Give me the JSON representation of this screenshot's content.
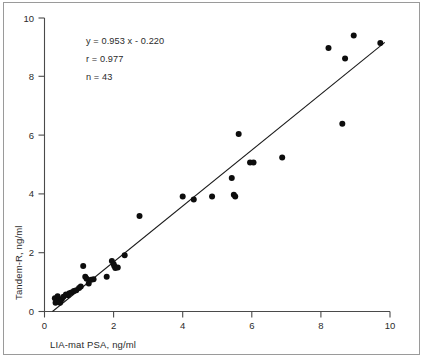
{
  "chart_data": {
    "type": "scatter",
    "title": "",
    "xlabel": "LIA-mat PSA, ng/ml",
    "ylabel": "Tandem-R, ng/ml",
    "xlim": [
      0,
      10
    ],
    "ylim": [
      0,
      10
    ],
    "xticks": [
      0,
      2,
      4,
      6,
      8,
      10
    ],
    "yticks": [
      0,
      2,
      4,
      6,
      8,
      10
    ],
    "xtick_labels": [
      "0",
      "2",
      "4",
      "6",
      "8",
      "10"
    ],
    "ytick_labels": [
      "0",
      "2",
      "4",
      "6",
      "8",
      "10"
    ],
    "grid": false,
    "legend": "none",
    "annotations": {
      "equation": "y = 0.953 x - 0.220",
      "correlation": "r = 0.977",
      "count": "n = 43"
    },
    "fit_line": {
      "slope": 0.953,
      "intercept": -0.22,
      "x_start": 0.23,
      "x_end": 9.85
    },
    "marker_color": "#0d0d0d",
    "axis_color": "#4a4a4a",
    "points": [
      {
        "x": 0.3,
        "y": 0.45
      },
      {
        "x": 0.32,
        "y": 0.3
      },
      {
        "x": 0.38,
        "y": 0.52
      },
      {
        "x": 0.42,
        "y": 0.38
      },
      {
        "x": 0.45,
        "y": 0.3
      },
      {
        "x": 0.5,
        "y": 0.42
      },
      {
        "x": 0.55,
        "y": 0.5
      },
      {
        "x": 0.62,
        "y": 0.58
      },
      {
        "x": 0.68,
        "y": 0.55
      },
      {
        "x": 0.72,
        "y": 0.62
      },
      {
        "x": 0.78,
        "y": 0.65
      },
      {
        "x": 0.85,
        "y": 0.7
      },
      {
        "x": 0.92,
        "y": 0.72
      },
      {
        "x": 1.0,
        "y": 0.8
      },
      {
        "x": 1.05,
        "y": 0.85
      },
      {
        "x": 1.12,
        "y": 1.55
      },
      {
        "x": 1.18,
        "y": 1.18
      },
      {
        "x": 1.22,
        "y": 1.12
      },
      {
        "x": 1.28,
        "y": 0.95
      },
      {
        "x": 1.35,
        "y": 1.08
      },
      {
        "x": 1.42,
        "y": 1.1
      },
      {
        "x": 1.8,
        "y": 1.18
      },
      {
        "x": 1.95,
        "y": 1.72
      },
      {
        "x": 2.0,
        "y": 1.62
      },
      {
        "x": 2.02,
        "y": 1.55
      },
      {
        "x": 2.05,
        "y": 1.48
      },
      {
        "x": 2.12,
        "y": 1.5
      },
      {
        "x": 2.32,
        "y": 1.92
      },
      {
        "x": 2.75,
        "y": 3.25
      },
      {
        "x": 4.0,
        "y": 3.92
      },
      {
        "x": 4.32,
        "y": 3.82
      },
      {
        "x": 4.85,
        "y": 3.92
      },
      {
        "x": 5.42,
        "y": 4.55
      },
      {
        "x": 5.48,
        "y": 3.98
      },
      {
        "x": 5.52,
        "y": 3.92
      },
      {
        "x": 5.62,
        "y": 6.05
      },
      {
        "x": 5.95,
        "y": 5.08
      },
      {
        "x": 6.05,
        "y": 5.08
      },
      {
        "x": 6.88,
        "y": 5.25
      },
      {
        "x": 8.22,
        "y": 8.98
      },
      {
        "x": 8.62,
        "y": 6.4
      },
      {
        "x": 8.7,
        "y": 8.62
      },
      {
        "x": 8.95,
        "y": 9.4
      },
      {
        "x": 9.72,
        "y": 9.15
      }
    ]
  }
}
